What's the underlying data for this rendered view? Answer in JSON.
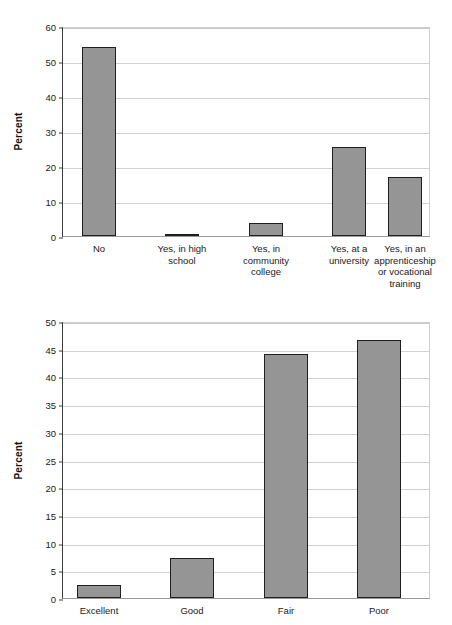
{
  "chart_data": [
    {
      "id": "top",
      "type": "bar",
      "title": "",
      "xlabel": "",
      "ylabel": "Percent",
      "ylim": [
        0,
        60
      ],
      "ytick_step": 10,
      "yticks": [
        0,
        10,
        20,
        30,
        40,
        50,
        60
      ],
      "grid": true,
      "legend": "none",
      "bar_color": "#959595",
      "bar_edge_color": "#1f1f1f",
      "categories": [
        "No",
        "Yes, in high\nschool",
        "Yes, in\ncommunity\ncollege",
        "Yes, at a\nuniversity",
        "Yes, in an\napprenticeship\nor vocational\ntraining"
      ],
      "values": [
        54.0,
        0.7,
        3.7,
        25.5,
        17.0
      ]
    },
    {
      "id": "bottom",
      "type": "bar",
      "title": "",
      "xlabel": "",
      "ylabel": "Percent",
      "ylim": [
        0,
        50
      ],
      "ytick_step": 5,
      "yticks": [
        0,
        5,
        10,
        15,
        20,
        25,
        30,
        35,
        40,
        45,
        50
      ],
      "grid": true,
      "legend": "none",
      "bar_color": "#959595",
      "bar_edge_color": "#1f1f1f",
      "categories": [
        "Excellent",
        "Good",
        "Fair",
        "Poor"
      ],
      "values": [
        2.4,
        7.3,
        44.0,
        46.5
      ]
    }
  ]
}
